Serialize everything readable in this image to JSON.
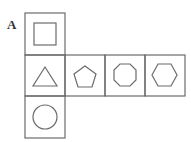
{
  "figure": {
    "label": "A",
    "faces": [
      {
        "position": "top",
        "shape": "square"
      },
      {
        "position": "middle-1",
        "shape": "triangle"
      },
      {
        "position": "middle-2",
        "shape": "pentagon"
      },
      {
        "position": "middle-3",
        "shape": "octagon"
      },
      {
        "position": "middle-4",
        "shape": "hexagon"
      },
      {
        "position": "bottom",
        "shape": "circle"
      }
    ],
    "stroke_color": "#6b6b6b"
  }
}
